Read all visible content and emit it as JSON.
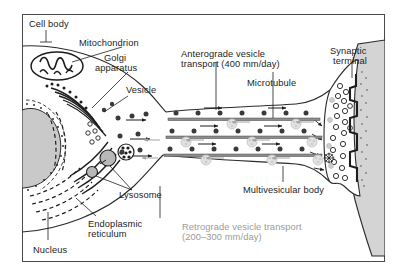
{
  "figure": {
    "frame_color": "#4a4a4a",
    "background": "#ffffff",
    "ink_color": "#1d1d1d",
    "retrograde_color": "#9a9a9a"
  },
  "labels": {
    "cell_body": "Cell body",
    "mitochondrion": "Mitochondrion",
    "golgi_line1": "Golgi",
    "golgi_line2": "apparatus",
    "vesicle": "Vesicle",
    "anterograde_line1": "Anterograde vesicle",
    "anterograde_line2": "transport (400 mm/day)",
    "microtubule": "Microtubule",
    "synaptic_line1": "Synaptic",
    "synaptic_line2": "terminal",
    "multivesicular_body": "Multivesicular body",
    "lysosome": "Lysosome",
    "endoplasmic_line1": "Endoplasmic",
    "endoplasmic_line2": "reticulum",
    "nucleus": "Nucleus",
    "retrograde_line1": "Retrograde vesicle transport",
    "retrograde_line2": "(200–300 mm/day)"
  },
  "structures": [
    {
      "name": "cell-body",
      "kind": "soma"
    },
    {
      "name": "nucleus",
      "kind": "organelle",
      "fill": "#c9c9c9"
    },
    {
      "name": "mitochondrion",
      "kind": "organelle"
    },
    {
      "name": "golgi-apparatus",
      "kind": "organelle"
    },
    {
      "name": "endoplasmic-reticulum",
      "kind": "organelle"
    },
    {
      "name": "vesicle",
      "kind": "cargo"
    },
    {
      "name": "lysosome",
      "kind": "organelle",
      "fill": "#b8b8b8"
    },
    {
      "name": "multivesicular-body",
      "kind": "organelle"
    },
    {
      "name": "microtubule",
      "kind": "cytoskeleton",
      "count": 3
    },
    {
      "name": "synaptic-terminal",
      "kind": "terminal"
    },
    {
      "name": "postsynaptic-cell",
      "kind": "cell",
      "fill": "#d0d0d0"
    }
  ],
  "transport": {
    "anterograde": {
      "direction": "soma-to-terminal",
      "rate": "400 mm/day",
      "color": "#1d1d1d"
    },
    "retrograde": {
      "direction": "terminal-to-soma",
      "rate": "200–300 mm/day",
      "color": "#9a9a9a"
    }
  }
}
